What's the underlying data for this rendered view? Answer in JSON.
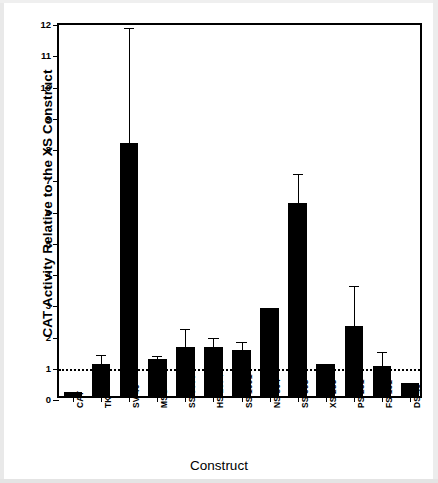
{
  "chart_data": {
    "type": "bar",
    "title": "",
    "xlabel": "Construct",
    "ylabel": "CAT Activity Relative to the XS Construct",
    "categories": [
      "CAT",
      "TK",
      "SV 40",
      "MSG",
      "SS 3000",
      "HS 1674",
      "SS 1091",
      "NS 804",
      "SS 698",
      "XS 285",
      "PS 231",
      "FS 161",
      "DS 49"
    ],
    "values": [
      0.12,
      1.02,
      8.1,
      1.18,
      1.58,
      1.58,
      1.48,
      2.82,
      6.18,
      1.03,
      2.25,
      0.97,
      0.42
    ],
    "errors_upper": [
      0.0,
      0.42,
      3.8,
      0.22,
      0.7,
      0.42,
      0.37,
      0.0,
      1.05,
      0.0,
      1.4,
      0.58,
      0.0
    ],
    "error_bar_tops": [
      null,
      1.44,
      11.9,
      1.4,
      2.28,
      2.0,
      1.85,
      null,
      7.23,
      null,
      3.65,
      1.55,
      null
    ],
    "ylim": [
      0,
      12
    ],
    "yticks": [
      0,
      1,
      2,
      3,
      4,
      5,
      6,
      7,
      8,
      9,
      10,
      11,
      12
    ],
    "ytick_labels": [
      "0",
      "1",
      "2",
      "3",
      "4",
      "5",
      "6",
      "7",
      "8",
      "9",
      "10",
      "11",
      "12"
    ],
    "reference_line": {
      "value": 1,
      "style": "dotted"
    },
    "grid": false,
    "legend": null,
    "bar_color": "#000000",
    "axis_color": "#000000",
    "xtick_label_rotation": -90
  },
  "axes": {
    "y_title": "CAT Activity Relative to the XS Construct",
    "x_title": "Construct"
  }
}
